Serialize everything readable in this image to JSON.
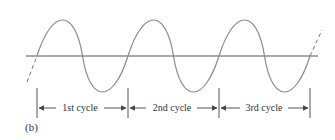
{
  "figure": {
    "caption": "(b)",
    "cycles": [
      {
        "label": "1st cycle",
        "x_start": 37,
        "x_end": 128
      },
      {
        "label": "2nd cycle",
        "x_start": 128,
        "x_end": 219
      },
      {
        "label": "3rd cycle",
        "x_start": 219,
        "x_end": 310
      }
    ],
    "colors": {
      "wave": "#8a8a8a",
      "axis": "#555555",
      "text": "#333333"
    }
  }
}
